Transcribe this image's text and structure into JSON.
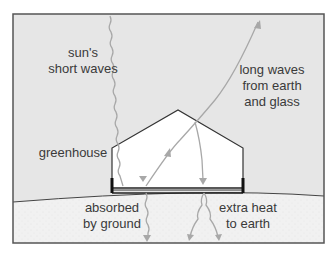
{
  "diagram": {
    "labels": {
      "sun_short_waves": [
        "sun's",
        "short waves"
      ],
      "long_waves": [
        "long waves",
        "from earth",
        "and glass"
      ],
      "greenhouse": "greenhouse",
      "absorbed": [
        "absorbed",
        "by ground"
      ],
      "extra_heat": [
        "extra heat",
        "to earth"
      ]
    },
    "colors": {
      "sky": "#e6e6e6",
      "ground": "#f1f1f1",
      "greenhouse_interior": "#ffffff",
      "outline": "#333333",
      "wave": "#a8a8a8",
      "text": "#3a3a3a"
    }
  }
}
